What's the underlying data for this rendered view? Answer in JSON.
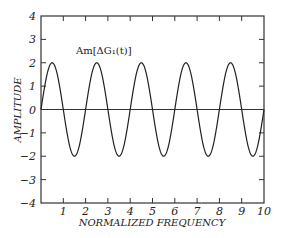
{
  "chart_data": {
    "type": "line",
    "title": "",
    "xlabel": "NORMALIZED FREQUENCY",
    "ylabel": "AMPLITUDE",
    "xlim": [
      0,
      10
    ],
    "ylim": [
      -4,
      4
    ],
    "x_ticks": [
      "1",
      "2",
      "3",
      "4",
      "5",
      "6",
      "7",
      "8",
      "9",
      "10"
    ],
    "y_ticks": [
      "4",
      "3",
      "2",
      "1",
      "0",
      "-1",
      "-2",
      "-3",
      "-4"
    ],
    "grid": false,
    "annotation": "Am[ΔG₁(t)]",
    "series": [
      {
        "name": "Am[ΔG₁(t)]",
        "function": "2*sin(pi*x)",
        "x": [
          0,
          0.5,
          1,
          1.5,
          2,
          2.5,
          3,
          3.5,
          4,
          4.5,
          5,
          5.5,
          6,
          6.5,
          7,
          7.5,
          8,
          8.5,
          9,
          9.5,
          10
        ],
        "values": [
          0,
          2,
          0,
          -2,
          0,
          2,
          0,
          -2,
          0,
          2,
          0,
          -2,
          0,
          2,
          0,
          -2,
          0,
          2,
          0,
          -2,
          0
        ]
      },
      {
        "name": "zero line",
        "x": [
          0,
          10
        ],
        "values": [
          0,
          0
        ]
      }
    ]
  }
}
